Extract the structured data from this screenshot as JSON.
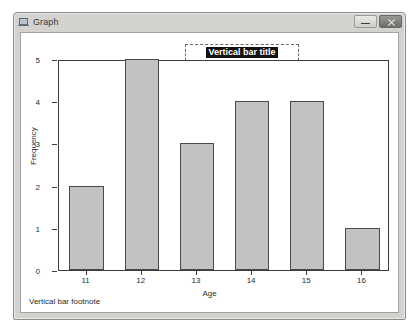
{
  "window": {
    "title": "Graph",
    "icon": "graph-window-icon",
    "buttons": [
      {
        "name": "minimize-button",
        "label": "–"
      },
      {
        "name": "close-button",
        "label": "×"
      }
    ]
  },
  "chart_data": {
    "type": "bar",
    "title": "Vertical bar title",
    "title_selected": true,
    "footnote": "Vertical bar footnote",
    "xlabel": "Age",
    "ylabel": "Frequency",
    "categories": [
      "11",
      "12",
      "13",
      "14",
      "15",
      "16"
    ],
    "values": [
      2,
      5,
      3,
      4,
      4,
      1
    ],
    "yticks": [
      0,
      1,
      2,
      3,
      4,
      5
    ],
    "ylim": [
      0,
      5
    ],
    "grid": false,
    "legend": null,
    "bar_fill": "#c2c2c2",
    "bar_border": "#4a4a4a"
  }
}
